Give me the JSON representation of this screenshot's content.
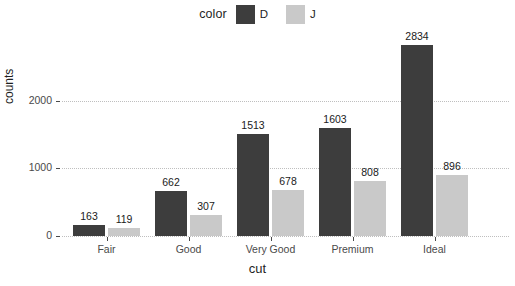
{
  "chart_data": {
    "type": "bar",
    "title": "",
    "xlabel": "cut",
    "ylabel": "counts",
    "categories": [
      "Fair",
      "Good",
      "Very Good",
      "Premium",
      "Ideal"
    ],
    "series": [
      {
        "name": "D",
        "color": "#3d3d3d",
        "values": [
          163,
          662,
          1513,
          1603,
          2834
        ]
      },
      {
        "name": "J",
        "color": "#c9c9c9",
        "values": [
          119,
          307,
          678,
          808,
          896
        ]
      }
    ],
    "legend": {
      "title": "color",
      "position": "top",
      "entries": [
        {
          "label": "D",
          "color": "#3d3d3d"
        },
        {
          "label": "J",
          "color": "#c9c9c9"
        }
      ]
    },
    "y_ticks": [
      0,
      1000,
      2000
    ],
    "y_tick_labels": [
      "0",
      "1000",
      "2000"
    ],
    "ylim": [
      0,
      3050
    ],
    "grid": "horizontal-dotted",
    "grid_color": "#bfbfbf",
    "background": "#ffffff",
    "data_labels": true
  }
}
